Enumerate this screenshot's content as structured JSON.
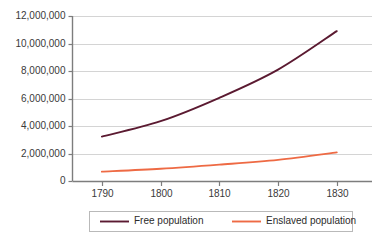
{
  "chart_data": {
    "type": "line",
    "title": "",
    "subtitle": "",
    "xlabel": "",
    "ylabel": "",
    "x": [
      1790,
      1800,
      1810,
      1820,
      1830
    ],
    "xtick_labels": [
      "1790",
      "1800",
      "1810",
      "1820",
      "1830"
    ],
    "xlim": [
      1785,
      1836
    ],
    "ylim": [
      0,
      12000000
    ],
    "ytick_values": [
      0,
      2000000,
      4000000,
      6000000,
      8000000,
      10000000,
      12000000
    ],
    "ytick_labels": [
      "0",
      "2,000,000",
      "4,000,000",
      "6,000,000",
      "8,000,000",
      "10,000,000",
      "12,000,000"
    ],
    "grid": true,
    "legend_position": "bottom",
    "series": [
      {
        "name": "Free population",
        "color": "#5B1A31",
        "values": [
          3230000,
          4350000,
          6050000,
          8100000,
          10900000
        ]
      },
      {
        "name": "Enslaved population",
        "color": "#EE6A44",
        "values": [
          680000,
          890000,
          1190000,
          1540000,
          2080000
        ]
      }
    ]
  },
  "legend": {
    "entries": [
      {
        "label": "Free population",
        "color": "#5B1A31"
      },
      {
        "label": "Enslaved population",
        "color": "#EE6A44"
      }
    ]
  },
  "colors": {
    "free_population": "#5B1A31",
    "enslaved_population": "#EE6A44",
    "gridline": "#d4d4d4",
    "axis": "#7d7d7d",
    "text": "#3a3a3a",
    "background": "#ffffff"
  }
}
